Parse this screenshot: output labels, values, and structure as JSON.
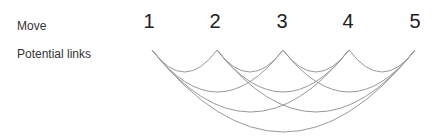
{
  "labels": {
    "move": "Move",
    "potential_links": "Potential links"
  },
  "moves": [
    "1",
    "2",
    "3",
    "4",
    "5"
  ],
  "arc_color": "#999999",
  "links": [
    [
      1,
      2
    ],
    [
      2,
      3
    ],
    [
      3,
      4
    ],
    [
      4,
      5
    ],
    [
      1,
      3
    ],
    [
      2,
      4
    ],
    [
      3,
      5
    ],
    [
      1,
      4
    ],
    [
      2,
      5
    ],
    [
      1,
      5
    ]
  ]
}
